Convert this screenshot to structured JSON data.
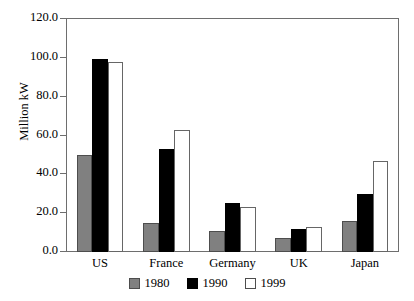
{
  "artifact_text": "                                         ",
  "chart_data": {
    "type": "bar",
    "title": "",
    "xlabel": "",
    "ylabel": "Million kW",
    "ylim": [
      0,
      120
    ],
    "ytick_step": 20,
    "ytick_labels": [
      "0.0",
      "20.0",
      "40.0",
      "60.0",
      "80.0",
      "100.0",
      "120.0"
    ],
    "ytick_values": [
      0,
      20,
      40,
      60,
      80,
      100,
      120
    ],
    "grid": false,
    "legend_position": "bottom",
    "categories": [
      "US",
      "France",
      "Germany",
      "UK",
      "Japan"
    ],
    "series": [
      {
        "name": "1980",
        "color": "#808080",
        "values": [
          50.0,
          15.0,
          11.0,
          7.0,
          16.0
        ]
      },
      {
        "name": "1990",
        "color": "#000000",
        "values": [
          99.5,
          53.0,
          25.0,
          12.0,
          30.0
        ]
      },
      {
        "name": "1999",
        "color": "#ffffff",
        "values": [
          98.0,
          63.0,
          23.0,
          13.0,
          47.0
        ]
      }
    ]
  }
}
